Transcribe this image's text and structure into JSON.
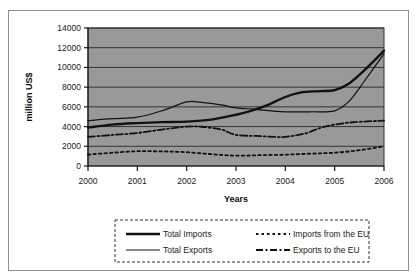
{
  "figure": {
    "caption_fragment": "",
    "background_color": "#ffffff",
    "frame_color": "#8c8c8c"
  },
  "chart_data": {
    "type": "line",
    "title": "",
    "xlabel": "Years",
    "ylabel": "million US$",
    "x": [
      2000,
      2001,
      2002,
      2003,
      2004,
      2005,
      2006
    ],
    "xtick_labels": [
      "2000",
      "2001",
      "2002",
      "2003",
      "2004",
      "2005",
      "2006"
    ],
    "ytick_labels": [
      "0",
      "2000",
      "4000",
      "6000",
      "8000",
      "10000",
      "12000",
      "14000"
    ],
    "yticks": [
      0,
      2000,
      4000,
      6000,
      8000,
      10000,
      12000,
      14000
    ],
    "ylim": [
      0,
      14000
    ],
    "xlim": [
      2000,
      2006
    ],
    "grid": "horizontal",
    "legend_position": "below-plot",
    "plot_background_color": "#999999",
    "gridline_color": "#333333",
    "series": [
      {
        "name": "Total Imports",
        "style": "solid-thick",
        "color": "#111111",
        "values": [
          3900,
          4350,
          4500,
          5200,
          7300,
          7700,
          11700
        ],
        "dense_x": [
          2000,
          2000.5,
          2001,
          2001.5,
          2002,
          2002.5,
          2003,
          2003.3,
          2003.6,
          2004,
          2004.3,
          2004.7,
          2005,
          2005.3,
          2005.6,
          2006
        ],
        "dense_y": [
          3900,
          4200,
          4350,
          4450,
          4500,
          4700,
          5200,
          5600,
          6100,
          7000,
          7450,
          7600,
          7700,
          8400,
          9700,
          11700
        ]
      },
      {
        "name": "Total Exports",
        "style": "solid-thin",
        "color": "#111111",
        "values": [
          4600,
          4950,
          6500,
          5900,
          5500,
          5550,
          11400
        ],
        "dense_x": [
          2000,
          2000.5,
          2001,
          2001.5,
          2002,
          2002.3,
          2002.7,
          2003,
          2003.4,
          2003.8,
          2004,
          2004.5,
          2005,
          2005.3,
          2005.6,
          2006
        ],
        "dense_y": [
          4600,
          4800,
          4950,
          5600,
          6500,
          6450,
          6200,
          5900,
          5750,
          5550,
          5500,
          5500,
          5600,
          6600,
          8600,
          11400
        ]
      },
      {
        "name": "Imports from the EU",
        "style": "dotted",
        "color": "#111111",
        "values": [
          1150,
          1500,
          1400,
          1050,
          1150,
          1350,
          2000
        ],
        "dense_x": [
          2000,
          2000.5,
          2001,
          2001.5,
          2002,
          2002.5,
          2003,
          2003.5,
          2004,
          2004.5,
          2005,
          2005.5,
          2006
        ],
        "dense_y": [
          1150,
          1350,
          1500,
          1480,
          1400,
          1200,
          1050,
          1100,
          1150,
          1250,
          1350,
          1600,
          2000
        ]
      },
      {
        "name": "Exports to the EU",
        "style": "dash-dot",
        "color": "#111111",
        "values": [
          2950,
          3350,
          4000,
          3150,
          2950,
          4200,
          4600
        ],
        "dense_x": [
          2000,
          2000.5,
          2001,
          2001.5,
          2002,
          2002.3,
          2002.7,
          2003,
          2003.4,
          2003.8,
          2004,
          2004.4,
          2004.7,
          2005,
          2005.4,
          2006
        ],
        "dense_y": [
          2950,
          3150,
          3350,
          3700,
          4000,
          3980,
          3700,
          3150,
          3050,
          2950,
          2950,
          3300,
          3850,
          4200,
          4450,
          4600
        ]
      }
    ],
    "legend": [
      {
        "label": "Total Imports",
        "style": "solid-thick"
      },
      {
        "label": "Imports from the EU",
        "style": "dotted"
      },
      {
        "label": "Total Exports",
        "style": "solid-thin"
      },
      {
        "label": "Exports to the EU",
        "style": "dash-dot"
      }
    ]
  }
}
